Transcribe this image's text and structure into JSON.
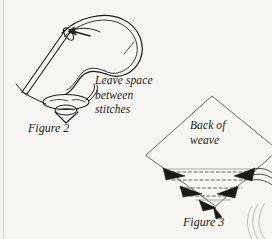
{
  "page": {
    "background_color": "#f7f6f2",
    "ink_color": "#1c1a17",
    "width": 272,
    "height": 239
  },
  "annotations": {
    "leave_space": "Leave space\nbetween\nstitches",
    "back_of_weave": "Back of\nweave"
  },
  "captions": {
    "figure_2": "Figure 2",
    "figure_3": "Figure 3"
  },
  "figures": [
    {
      "id": "figure-2",
      "caption": "Figure 2",
      "annotation": "Leave space between stitches",
      "elements": [
        "sewing-needle",
        "needle-eye",
        "thread-loop",
        "direction-arrow",
        "bead-oval",
        "stitch-triangle"
      ]
    },
    {
      "id": "figure-3",
      "caption": "Figure 3",
      "annotation": "Back of weave",
      "elements": [
        "weave-diamond",
        "dashed-stitch-lines",
        "thread-wedges",
        "thread-strands",
        "corner-curls"
      ]
    }
  ]
}
